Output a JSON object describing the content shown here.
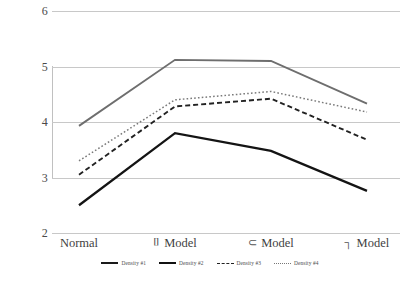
{
  "chart_data": {
    "type": "line",
    "title": "",
    "xlabel": "",
    "ylabel": "",
    "ylim": [
      2,
      6
    ],
    "yticks": [
      6,
      5,
      4,
      3,
      2
    ],
    "grid": true,
    "legend_position": "bottom",
    "categories": [
      "Normal",
      "Model",
      "Model",
      "Model"
    ],
    "category_glyphs": [
      "",
      "⌷",
      "⊂",
      "┐"
    ],
    "series": [
      {
        "name": "Density #1",
        "style": "solid-gray",
        "color": "#6e6e6e",
        "values": [
          3.93,
          5.12,
          5.1,
          4.33
        ]
      },
      {
        "name": "Density #2",
        "style": "dotted",
        "color": "#7a7a7a",
        "values": [
          3.3,
          4.4,
          4.55,
          4.18
        ]
      },
      {
        "name": "Density #3",
        "style": "dashed",
        "color": "#222222",
        "values": [
          3.05,
          4.28,
          4.42,
          3.68
        ]
      },
      {
        "name": "Density #4",
        "style": "solid-black",
        "color": "#141414",
        "values": [
          2.5,
          3.8,
          3.48,
          2.76
        ]
      }
    ]
  },
  "axis": {
    "y_tick_labels": [
      "6",
      "5",
      "4",
      "3",
      "2"
    ]
  },
  "xaxis": {
    "labels": [
      {
        "glyph": "",
        "text": "Normal"
      },
      {
        "glyph": "⌷",
        "text": "Model"
      },
      {
        "glyph": "⊂",
        "text": "Model"
      },
      {
        "glyph": "┐",
        "text": "Model"
      }
    ]
  },
  "legend": {
    "items": [
      {
        "label": "Density #1",
        "style": "solid-thick"
      },
      {
        "label": "Density #2",
        "style": "solid-thick2"
      },
      {
        "label": "Density #3",
        "style": "dashed"
      },
      {
        "label": "Density #4",
        "style": "dotted"
      }
    ]
  },
  "colors": {
    "gridline": "#c8c8c8",
    "text": "#3a3a3a",
    "background": "#ffffff"
  }
}
